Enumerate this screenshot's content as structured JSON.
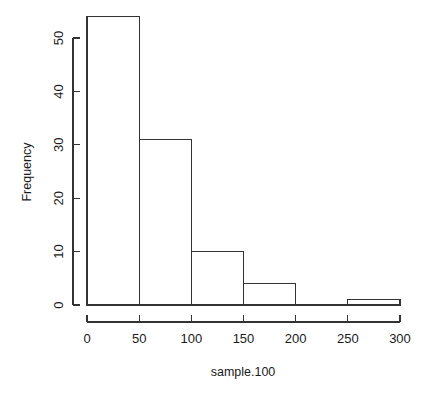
{
  "chart_data": {
    "type": "bar",
    "title": "",
    "subtitle": "",
    "xlabel": "sample.100",
    "ylabel": "Frequency",
    "grid": false,
    "legend": "none",
    "bin_width": 50,
    "bin_edges": [
      0,
      50,
      100,
      150,
      200,
      250,
      300
    ],
    "categories": [
      "0-50",
      "50-100",
      "100-150",
      "150-200",
      "200-250",
      "250-300"
    ],
    "values": [
      54,
      31,
      10,
      4,
      0,
      1
    ],
    "bars": [
      {
        "x0": 0,
        "x1": 50,
        "count": 54
      },
      {
        "x0": 50,
        "x1": 100,
        "count": 31
      },
      {
        "x0": 100,
        "x1": 150,
        "count": 10
      },
      {
        "x0": 150,
        "x1": 200,
        "count": 4
      },
      {
        "x0": 200,
        "x1": 250,
        "count": 0
      },
      {
        "x0": 250,
        "x1": 300,
        "count": 1
      }
    ],
    "xlim": [
      0,
      300
    ],
    "ylim": [
      0,
      54
    ],
    "xticks": [
      0,
      50,
      100,
      150,
      200,
      250,
      300
    ],
    "xtick_labels": [
      "0",
      "50",
      "100",
      "150",
      "200",
      "250",
      "300"
    ],
    "yticks": [
      0,
      10,
      20,
      30,
      40,
      50
    ],
    "ytick_labels": [
      "0",
      "10",
      "20",
      "30",
      "40",
      "50"
    ]
  },
  "axes": {
    "x_title": "sample.100",
    "y_title": "Frequency"
  },
  "style": {
    "line_color": "#333333",
    "text_color": "#1a1a1a",
    "bar_fill": "#ffffff",
    "background": "#ffffff"
  }
}
